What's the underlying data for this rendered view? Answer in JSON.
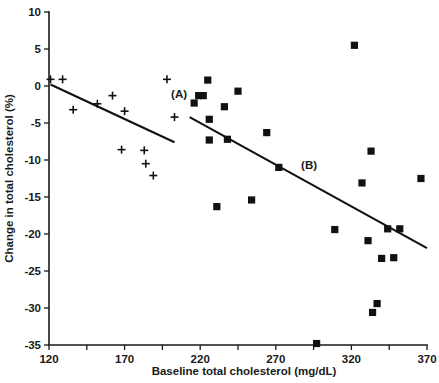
{
  "chart_data": {
    "type": "scatter",
    "title": "",
    "xlabel": "Baseline total cholesterol (mg/dL)",
    "ylabel": "Change in total  cholesterol (%)",
    "xlim": [
      120,
      370
    ],
    "ylim": [
      -35,
      10
    ],
    "xticks_labeled": [
      120,
      170,
      220,
      270,
      320,
      370
    ],
    "xticks_minor": [
      145,
      195,
      245,
      295,
      345
    ],
    "yticks_labeled": [
      10,
      5,
      0,
      -5,
      -10,
      -15,
      -20,
      -25,
      -30,
      -35
    ],
    "xtick_labels": [
      "120",
      "170",
      "220",
      "270",
      "320",
      "370"
    ],
    "ytick_labels": [
      "10",
      "5",
      "0",
      "-5",
      "-10",
      "-15",
      "-20",
      "-25",
      "-30",
      "-35"
    ],
    "grid": false,
    "legend": "none",
    "annotations": [
      {
        "text": "(A)",
        "x": 206,
        "y": -1.6
      },
      {
        "text": "(B)",
        "x": 292,
        "y": -11.2
      }
    ],
    "series": [
      {
        "name": "Group A",
        "marker": "plus",
        "color": "#111111",
        "points": [
          {
            "x": 121,
            "y": 0.9
          },
          {
            "x": 129,
            "y": 0.9
          },
          {
            "x": 136,
            "y": -3.2
          },
          {
            "x": 152,
            "y": -2.4
          },
          {
            "x": 162,
            "y": -1.3
          },
          {
            "x": 168,
            "y": -8.6
          },
          {
            "x": 170,
            "y": -3.4
          },
          {
            "x": 183,
            "y": -8.7
          },
          {
            "x": 184,
            "y": -10.5
          },
          {
            "x": 189,
            "y": -12.1
          },
          {
            "x": 198,
            "y": 0.9
          },
          {
            "x": 203,
            "y": -4.2
          }
        ]
      },
      {
        "name": "Group B",
        "marker": "square",
        "color": "#111111",
        "points": [
          {
            "x": 216,
            "y": -2.3
          },
          {
            "x": 219,
            "y": -1.3
          },
          {
            "x": 222,
            "y": -1.3
          },
          {
            "x": 225,
            "y": 0.8
          },
          {
            "x": 226,
            "y": -4.5
          },
          {
            "x": 226,
            "y": -7.3
          },
          {
            "x": 231,
            "y": -16.3
          },
          {
            "x": 236,
            "y": -2.8
          },
          {
            "x": 238,
            "y": -7.2
          },
          {
            "x": 245,
            "y": -0.7
          },
          {
            "x": 254,
            "y": -15.4
          },
          {
            "x": 264,
            "y": -6.3
          },
          {
            "x": 272,
            "y": -11.0
          },
          {
            "x": 297,
            "y": -34.8
          },
          {
            "x": 309,
            "y": -19.4
          },
          {
            "x": 322,
            "y": 5.5
          },
          {
            "x": 327,
            "y": -13.1
          },
          {
            "x": 331,
            "y": -20.9
          },
          {
            "x": 333,
            "y": -8.8
          },
          {
            "x": 334,
            "y": -30.6
          },
          {
            "x": 337,
            "y": -29.4
          },
          {
            "x": 340,
            "y": -23.3
          },
          {
            "x": 344,
            "y": -19.3
          },
          {
            "x": 348,
            "y": -23.2
          },
          {
            "x": 352,
            "y": -19.3
          },
          {
            "x": 366,
            "y": -12.5
          }
        ]
      }
    ],
    "fit_lines": [
      {
        "name": "A",
        "x1": 121,
        "y1": 0.2,
        "x2": 203,
        "y2": -7.6
      },
      {
        "name": "B",
        "x1": 213,
        "y1": -4.2,
        "x2": 370,
        "y2": -21.9
      }
    ]
  }
}
